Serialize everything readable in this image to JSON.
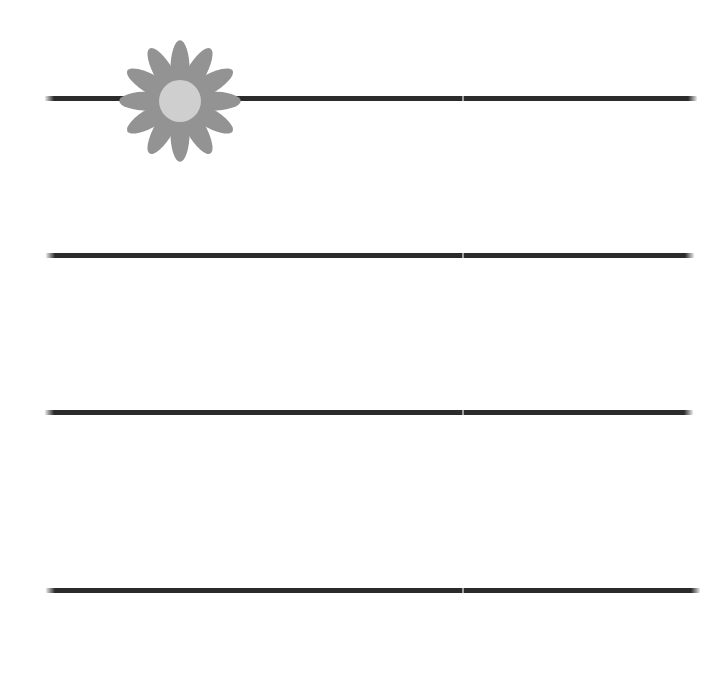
{
  "page": {
    "width": 713,
    "height": 680,
    "background_color": "#ffffff"
  },
  "colors": {
    "line": "#2b2b2b",
    "petal": "#939393",
    "flower_center": "#cfcfcf",
    "background": "#ffffff"
  },
  "rules": {
    "count": 4,
    "lines": [
      {
        "id": "rule-line-1",
        "label": "Writing line 1",
        "x": 45,
        "y": 96,
        "width": 652,
        "thickness": 5,
        "seam_x": 462
      },
      {
        "id": "rule-line-2",
        "label": "Writing line 2",
        "x": 46,
        "y": 253,
        "width": 648,
        "thickness": 5,
        "seam_x": 462
      },
      {
        "id": "rule-line-3",
        "label": "Writing line 3",
        "x": 45,
        "y": 410,
        "width": 648,
        "thickness": 5,
        "seam_x": 462
      },
      {
        "id": "rule-line-4",
        "label": "Writing line 4",
        "x": 46,
        "y": 588,
        "width": 654,
        "thickness": 5,
        "seam_x": 462
      }
    ]
  },
  "decoration": {
    "name": "daisy-flower",
    "label": "Daisy flower illustration",
    "petal_count": 12,
    "center_x": 180,
    "center_y": 101,
    "bounds": {
      "x": 118,
      "y": 29,
      "width": 124,
      "height": 144
    },
    "petal_color": "#939393",
    "center_color": "#cfcfcf",
    "center_radius": 21
  }
}
